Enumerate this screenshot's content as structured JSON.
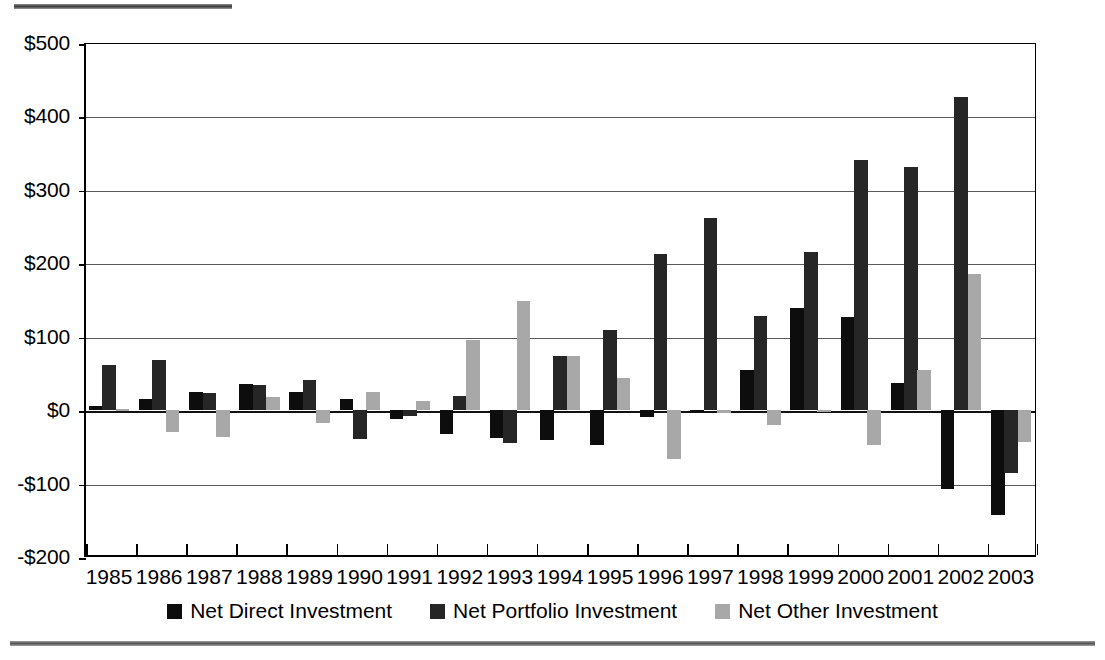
{
  "rules": {
    "top_rule": "",
    "bottom_rule": ""
  },
  "legend": {
    "position": "bottom-center",
    "items": [
      {
        "label": "Net Direct Investment",
        "key": "direct",
        "color": "#0d0d0d"
      },
      {
        "label": "Net Portfolio Investment",
        "key": "portfolio",
        "color": "#262626"
      },
      {
        "label": "Net Other Investment",
        "key": "other",
        "color": "#a8a8a8"
      }
    ]
  },
  "axis": {
    "y_ticks": [
      "$500",
      "$400",
      "$300",
      "$200",
      "$100",
      "$0",
      "-$100",
      "-$200"
    ],
    "y_values": [
      500,
      400,
      300,
      200,
      100,
      0,
      -100,
      -200
    ]
  },
  "chart_data": {
    "type": "bar",
    "title": "",
    "subtitle": "",
    "xlabel": "",
    "ylabel": "",
    "ylim": [
      -200,
      500
    ],
    "ytick_labels": [
      "$500",
      "$400",
      "$300",
      "$200",
      "$100",
      "$0",
      "-$100",
      "-$200"
    ],
    "ytick_values": [
      500,
      400,
      300,
      200,
      100,
      0,
      -100,
      -200
    ],
    "grid": true,
    "legend_position": "bottom-center",
    "units": "billions of dollars",
    "categories": [
      "1985",
      "1986",
      "1987",
      "1988",
      "1989",
      "1990",
      "1991",
      "1992",
      "1993",
      "1994",
      "1995",
      "1996",
      "1997",
      "1998",
      "1999",
      "2000",
      "2001",
      "2002",
      "2003"
    ],
    "series": [
      {
        "name": "Net Direct Investment",
        "color": "#0d0d0d",
        "values": [
          5,
          15,
          25,
          36,
          25,
          15,
          -12,
          -32,
          -38,
          -41,
          -48,
          -9,
          -3,
          54,
          139,
          127,
          37,
          -108,
          -143
        ]
      },
      {
        "name": "Net Portfolio Investment",
        "color": "#262626",
        "values": [
          61,
          68,
          23,
          34,
          41,
          -39,
          -8,
          19,
          -45,
          74,
          109,
          212,
          262,
          128,
          215,
          341,
          331,
          427,
          -85
        ]
      },
      {
        "name": "Net Other Investment",
        "color": "#a8a8a8",
        "values": [
          1,
          -30,
          -36,
          18,
          -18,
          25,
          13,
          95,
          148,
          74,
          44,
          -66,
          -4,
          -20,
          -3,
          -47,
          55,
          185,
          -43
        ]
      }
    ]
  }
}
